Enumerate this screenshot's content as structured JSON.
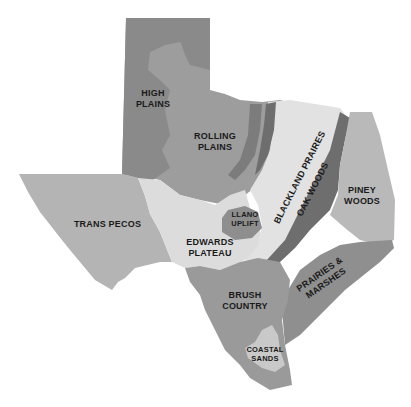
{
  "map": {
    "title": "Texas Ecological Regions",
    "colors": {
      "background": "#ffffff",
      "high_plains": "#8a8a8a",
      "rolling_plains": "#9d9d9d",
      "trans_pecos": "#b4b4b4",
      "edwards_plateau": "#dcdcdc",
      "llano_uplift": "#8e8e8e",
      "blackland_prairies": "#e2e2e2",
      "oak_woods": "#6e6e6e",
      "piney_woods": "#b9b9b9",
      "prairies_marshes": "#8f8f8f",
      "brush_country": "#9a9a9a",
      "coastal_sands": "#c9c9c9",
      "label_text": "#1a1a1a"
    },
    "regions": [
      {
        "id": "high_plains",
        "label": "HIGH\nPLAINS"
      },
      {
        "id": "rolling_plains",
        "label": "ROLLING\nPLAINS"
      },
      {
        "id": "trans_pecos",
        "label": "TRANS PECOS"
      },
      {
        "id": "edwards_plateau",
        "label": "EDWARDS\nPLATEAU"
      },
      {
        "id": "llano_uplift",
        "label": "LLANO\nUPLIFT"
      },
      {
        "id": "blackland_prairies",
        "label": "BLACKLAND PRAIRES"
      },
      {
        "id": "oak_woods",
        "label": "OAK WOODS"
      },
      {
        "id": "piney_woods",
        "label": "PINEY\nWOODS"
      },
      {
        "id": "prairies_marshes",
        "label": "PRAIRIES &\nMARSHES"
      },
      {
        "id": "brush_country",
        "label": "BRUSH\nCOUNTRY"
      },
      {
        "id": "coastal_sands",
        "label": "COASTAL\nSANDS"
      }
    ]
  }
}
